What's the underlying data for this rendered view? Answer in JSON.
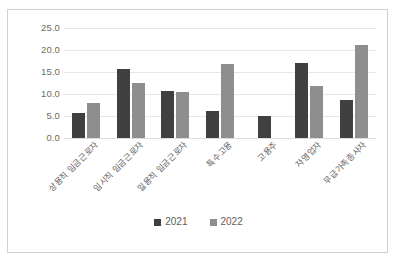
{
  "chart_data": {
    "type": "bar",
    "title": "",
    "subtitle": "",
    "xlabel": "",
    "ylabel": "",
    "ylim": [
      0,
      25
    ],
    "ytick_labels": [
      "25.0",
      "20.0",
      "15.0",
      "10.0",
      "5.0",
      "0.0"
    ],
    "ytick_values": [
      25.0,
      20.0,
      15.0,
      10.0,
      5.0,
      0.0
    ],
    "grid": true,
    "legend_position": "bottom",
    "categories": [
      "상용직 임금근로자",
      "임시직 임금근로자",
      "일용직 임금근로자",
      "특수고용",
      "고용주",
      "자영업자",
      "무급가족종사자"
    ],
    "series": [
      {
        "name": "2021",
        "color": "#404040",
        "values": [
          5.7,
          15.6,
          10.7,
          6.2,
          5.0,
          17.1,
          8.6
        ]
      },
      {
        "name": "2022",
        "color": "#8e8e8e",
        "values": [
          8.0,
          12.6,
          10.5,
          16.9,
          0,
          11.8,
          21.2
        ]
      }
    ]
  },
  "legend": {
    "items": [
      {
        "label": "2021",
        "color": "#404040"
      },
      {
        "label": "2022",
        "color": "#8e8e8e"
      }
    ]
  },
  "colors": {
    "series_2021": "#404040",
    "series_2022": "#8e8e8e",
    "grid": "#e6e6e6",
    "axis_text": "#5e5e5e",
    "border": "#d0d0d0",
    "background": "#ffffff"
  }
}
